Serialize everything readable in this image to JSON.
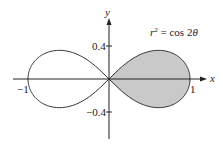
{
  "chart_data": {
    "type": "line",
    "title": "",
    "curve_label": "r² = cos 2θ",
    "curve_label_parts": {
      "r": "r",
      "sup": "2",
      "rest": " = cos 2",
      "theta": "θ"
    },
    "xlabel": "x",
    "ylabel": "y",
    "xlim": [
      -1.1,
      1.15
    ],
    "ylim": [
      -0.75,
      0.75
    ],
    "xticks": [
      {
        "value": -1,
        "label": "−1"
      },
      {
        "value": 1,
        "label": "1"
      }
    ],
    "yticks": [
      {
        "value": 0.4,
        "label": "0.4"
      },
      {
        "value": -0.4,
        "label": "−0.4"
      }
    ],
    "grid": false,
    "series": [
      {
        "name": "lemniscate r^2 = cos 2θ",
        "equation": "r^2 = cos(2θ)",
        "shaded_region": "right loop (−π/4 ≤ θ ≤ π/4)",
        "fill_color": "#c8c8c8"
      }
    ]
  }
}
